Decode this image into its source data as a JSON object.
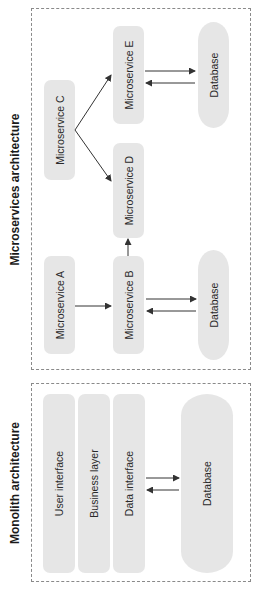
{
  "diagram": {
    "orientation": "rotated -90deg (text reads bottom-to-top)",
    "colors": {
      "node_fill": "#e6e6e6",
      "frame_border": "#8a8a8a",
      "arrow": "#333333",
      "title_text": "#1a1a1a"
    },
    "microservices": {
      "title": "Microservices architecture",
      "nodes": {
        "a": "Microservice A",
        "b": "Microservice B",
        "c": "Microservice C",
        "d": "Microservice D",
        "e": "Microservice E"
      },
      "databases": {
        "b_db": "Database",
        "e_db": "Database"
      },
      "edges": [
        {
          "from": "Microservice A",
          "to": "Microservice B"
        },
        {
          "from": "Microservice B",
          "to": "Microservice D"
        },
        {
          "from": "Microservice C",
          "to": "Microservice D"
        },
        {
          "from": "Microservice C",
          "to": "Microservice E"
        },
        {
          "from": "Microservice B",
          "to": "Database",
          "bidirectional": true
        },
        {
          "from": "Microservice E",
          "to": "Database",
          "bidirectional": true
        }
      ]
    },
    "monolith": {
      "title": "Monolith architecture",
      "layers": [
        "User interface",
        "Business layer",
        "Data interface"
      ],
      "database": "Database",
      "edges": [
        {
          "from": "Data interface",
          "to": "Database",
          "bidirectional": true
        }
      ]
    }
  }
}
